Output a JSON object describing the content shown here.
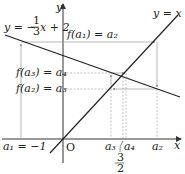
{
  "diagram": {
    "axes": {
      "x_label": "x",
      "y_label": "y",
      "origin_label": "O"
    },
    "lines": [
      {
        "name": "identity",
        "label": "y = x"
      },
      {
        "name": "f",
        "label_prefix": "y = −",
        "fraction": {
          "num": "1",
          "den": "3"
        },
        "label_suffix": "x + 2"
      }
    ],
    "horizontal_labels": [
      {
        "text": "f(a₁) = a₂"
      },
      {
        "text": "f(a₃) = a₄"
      },
      {
        "text": "f(a₂) = a₃"
      }
    ],
    "x_ticks": [
      {
        "text": "a₁ = −1"
      },
      {
        "text": "a₃"
      },
      {
        "text": "a₄"
      },
      {
        "text": "a₂"
      }
    ],
    "fixed_point": {
      "num": "3",
      "den": "2"
    },
    "colors": {
      "main_line": "#222222",
      "guide_line": "#9a9a9a",
      "axis": "#333333"
    }
  }
}
